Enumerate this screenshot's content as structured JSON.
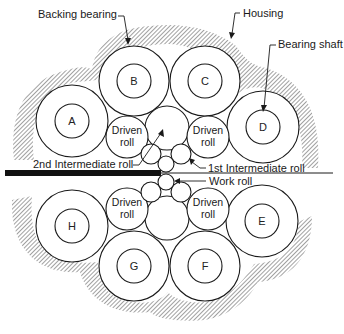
{
  "diagram": {
    "type": "20-high (cluster) rolling mill roll arrangement, cross-section",
    "labels": {
      "backing_bearing": "Backing bearing",
      "housing": "Housing",
      "bearing_shaft": "Bearing shaft",
      "second_intermediate_roll": "2nd Intermediate roll",
      "first_intermediate_roll": "1st Intermediate roll",
      "work_roll": "Work roll"
    },
    "driven_roll_label": [
      "Driven",
      "roll"
    ],
    "backing_bearings": [
      {
        "id": "A",
        "label": "A",
        "cx": 72,
        "cy": 121,
        "r_outer": 36,
        "r_inner": 17
      },
      {
        "id": "B",
        "label": "B",
        "cx": 134,
        "cy": 81,
        "r_outer": 35,
        "r_inner": 17
      },
      {
        "id": "C",
        "label": "C",
        "cx": 205,
        "cy": 81,
        "r_outer": 35,
        "r_inner": 17
      },
      {
        "id": "D",
        "label": "D",
        "cx": 263,
        "cy": 127,
        "r_outer": 36,
        "r_inner": 17
      },
      {
        "id": "E",
        "label": "E",
        "cx": 262,
        "cy": 221,
        "r_outer": 36,
        "r_inner": 17
      },
      {
        "id": "F",
        "label": "F",
        "cx": 205,
        "cy": 266,
        "r_outer": 35,
        "r_inner": 17
      },
      {
        "id": "G",
        "label": "G",
        "cx": 134,
        "cy": 266,
        "r_outer": 35,
        "r_inner": 17
      },
      {
        "id": "H",
        "label": "H",
        "cx": 72,
        "cy": 226,
        "r_outer": 36,
        "r_inner": 17
      }
    ],
    "driven_rolls": [
      {
        "cx": 127,
        "cy": 137,
        "r": 21
      },
      {
        "cx": 208,
        "cy": 137,
        "r": 21
      },
      {
        "cx": 127,
        "cy": 209,
        "r": 21
      },
      {
        "cx": 208,
        "cy": 209,
        "r": 21
      }
    ],
    "second_intermediate_rolls": [
      {
        "cx": 167,
        "cy": 128,
        "r": 22
      },
      {
        "cx": 167,
        "cy": 218,
        "r": 22
      }
    ],
    "first_intermediate_rolls": [
      {
        "cx": 151,
        "cy": 154,
        "r": 10
      },
      {
        "cx": 181,
        "cy": 154,
        "r": 10
      },
      {
        "cx": 151,
        "cy": 192,
        "r": 10
      },
      {
        "cx": 181,
        "cy": 192,
        "r": 10
      }
    ],
    "work_rolls": [
      {
        "cx": 166,
        "cy": 164,
        "r": 8
      },
      {
        "cx": 166,
        "cy": 182,
        "r": 8
      }
    ],
    "strip": {
      "thick_x1": 5,
      "thick_x2": 160,
      "thin_x2": 333,
      "y": 173
    },
    "colors": {
      "ink": "#1a1a1a",
      "background": "#ffffff",
      "hatch": "#555555"
    }
  }
}
